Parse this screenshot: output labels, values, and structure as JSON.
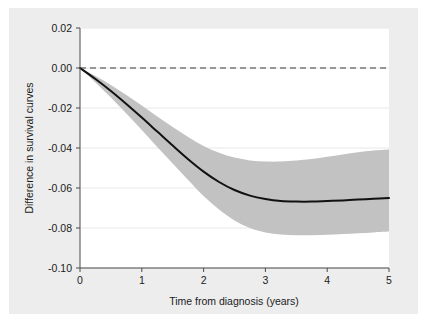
{
  "chart_data": {
    "type": "line",
    "title": "",
    "subtitle": "",
    "xlabel": "Time from diagnosis (years)",
    "ylabel": "Difference in survival curves",
    "xlim": [
      0,
      5
    ],
    "ylim": [
      -0.1,
      0.02
    ],
    "xticks": [
      0,
      1,
      2,
      3,
      4,
      5
    ],
    "xticklabels": [
      "0",
      "1",
      "2",
      "3",
      "4",
      "5"
    ],
    "yticks": [
      0.02,
      0.0,
      -0.02,
      -0.04,
      -0.06,
      -0.08,
      -0.1
    ],
    "yticklabels": [
      "0.02",
      "0.00",
      "-0.02",
      "-0.04",
      "-0.06",
      "-0.08",
      "-0.10"
    ],
    "grid": "horizontal-light",
    "legend": "none",
    "reference_line": {
      "name": "zero-reference",
      "orientation": "horizontal",
      "y": 0.0,
      "style": "dashed",
      "color": "#3b3b3b"
    },
    "x": [
      0,
      0.25,
      0.5,
      0.75,
      1.0,
      1.25,
      1.5,
      1.75,
      2.0,
      2.25,
      2.5,
      2.75,
      3.0,
      3.25,
      3.5,
      3.75,
      4.0,
      4.25,
      4.5,
      4.75,
      5.0
    ],
    "series": [
      {
        "name": "Difference in survival curves",
        "type": "line",
        "color": "#111111",
        "values": [
          0.0,
          -0.0055,
          -0.0115,
          -0.018,
          -0.0248,
          -0.0318,
          -0.0388,
          -0.0456,
          -0.0518,
          -0.057,
          -0.061,
          -0.0638,
          -0.0655,
          -0.0665,
          -0.0668,
          -0.0668,
          -0.0665,
          -0.0662,
          -0.0658,
          -0.0654,
          -0.065
        ]
      },
      {
        "name": "95% confidence band upper",
        "type": "band-upper",
        "color": "#bfbfbf",
        "values": [
          0.0,
          -0.004,
          -0.0085,
          -0.0135,
          -0.0188,
          -0.0242,
          -0.0295,
          -0.0345,
          -0.039,
          -0.0424,
          -0.0448,
          -0.0462,
          -0.0468,
          -0.0468,
          -0.0463,
          -0.0455,
          -0.0444,
          -0.0432,
          -0.0421,
          -0.0413,
          -0.0408
        ]
      },
      {
        "name": "95% confidence band lower",
        "type": "band-lower",
        "color": "#bfbfbf",
        "values": [
          0.0,
          -0.0072,
          -0.0148,
          -0.0228,
          -0.031,
          -0.0395,
          -0.0478,
          -0.056,
          -0.064,
          -0.0708,
          -0.0762,
          -0.08,
          -0.0822,
          -0.0832,
          -0.0836,
          -0.0836,
          -0.0834,
          -0.083,
          -0.0826,
          -0.0822,
          -0.0818
        ]
      }
    ],
    "colors": {
      "figure_background": "#ededed",
      "page_background": "#ffffff",
      "plot_background": "#ffffff",
      "band_fill": "#c2c2c2",
      "line": "#111111",
      "axis": "#4a4a4a",
      "gridline": "#e4e8ea",
      "text": "#1b1b1b"
    }
  }
}
